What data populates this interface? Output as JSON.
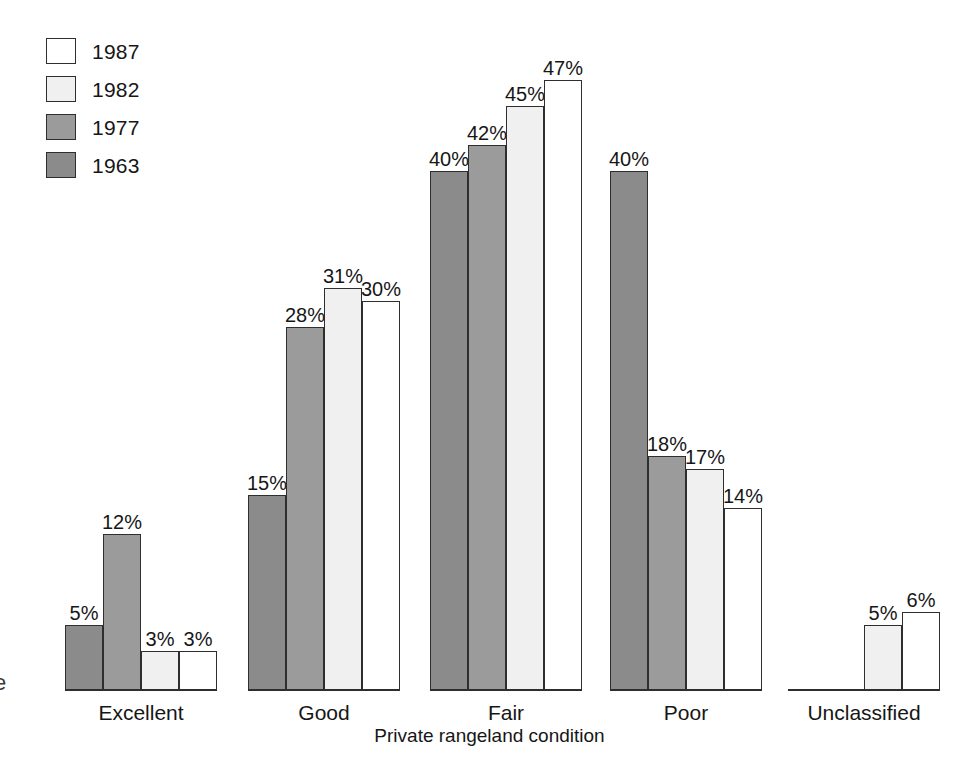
{
  "legend": {
    "items": [
      {
        "label": "1987",
        "color": "#ffffff"
      },
      {
        "label": "1982",
        "color": "#f0f0f0"
      },
      {
        "label": "1977",
        "color": "#9b9b9b"
      },
      {
        "label": "1963",
        "color": "#8b8b8b"
      }
    ]
  },
  "axis": {
    "x_title": "Private rangeland condition",
    "edge_glyph": "e"
  },
  "chart_data": {
    "type": "bar",
    "title": "",
    "xlabel": "Private rangeland condition",
    "ylabel": "",
    "ylim": [
      0,
      50
    ],
    "grid": false,
    "legend_position": "top-left",
    "value_suffix": "%",
    "categories": [
      "Excellent",
      "Good",
      "Fair",
      "Poor",
      "Unclassified"
    ],
    "series": [
      {
        "name": "1963",
        "color": "#8b8b8b",
        "values": [
          5,
          15,
          40,
          40,
          null
        ],
        "labels": [
          "5%",
          "15%",
          "40%",
          "40%",
          ""
        ]
      },
      {
        "name": "1977",
        "color": "#9b9b9b",
        "values": [
          12,
          28,
          42,
          18,
          null
        ],
        "labels": [
          "12%",
          "28%",
          "42%",
          "18%",
          ""
        ]
      },
      {
        "name": "1982",
        "color": "#f0f0f0",
        "values": [
          3,
          31,
          45,
          17,
          5
        ],
        "labels": [
          "3%",
          "31%",
          "45%",
          "17%",
          "5%"
        ]
      },
      {
        "name": "1987",
        "color": "#ffffff",
        "values": [
          3,
          30,
          47,
          14,
          6
        ],
        "labels": [
          "3%",
          "30%",
          "47%",
          "14%",
          "6%"
        ]
      }
    ]
  },
  "geometry": {
    "baseline_y": 690,
    "px_per_percent": 12.98,
    "bar_width": 38,
    "group_lefts": [
      65,
      248,
      430,
      610,
      788
    ]
  }
}
